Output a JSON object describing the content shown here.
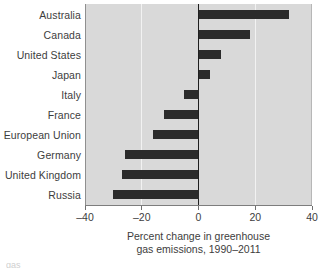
{
  "chart_data": {
    "type": "bar",
    "orientation": "horizontal",
    "title": "",
    "subtitle": "",
    "xlabel": "Percent change in greenhouse gas emissions, 1990–2011",
    "xlabel_line1": "Percent change in greenhouse",
    "xlabel_line2": "gas emissions, 1990–2011",
    "ylabel": "",
    "categories": [
      "Australia",
      "Canada",
      "United States",
      "Japan",
      "Italy",
      "France",
      "European Union",
      "Germany",
      "United Kingdom",
      "Russia"
    ],
    "values": [
      32,
      18,
      8,
      4,
      -5,
      -12,
      -16,
      -26,
      -27,
      -30
    ],
    "xlim": [
      -40,
      40
    ],
    "xticks": [
      -40,
      -20,
      0,
      20,
      40
    ],
    "xtick_labels": [
      "–40",
      "–20",
      "0",
      "20",
      "40"
    ],
    "grid": true,
    "gridlines_at": [
      -20,
      20
    ],
    "zero_line_at": 0,
    "legend": null,
    "legend_position": "none",
    "colors": {
      "bar": "#2b2b2b",
      "plot_background": "#d9d9d9",
      "gridline": "#f2f2f2",
      "zero_line": "#1f1f1f",
      "axis": "#7d7d7d",
      "text": "#3d3d3d",
      "page_background": "#ffffff"
    }
  },
  "footer": {
    "fragment": "gas"
  }
}
